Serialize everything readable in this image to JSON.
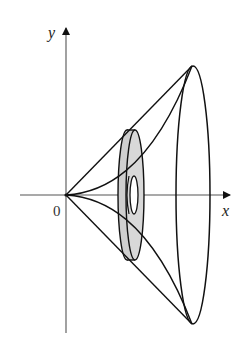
{
  "figure": {
    "axes": {
      "x_label": "x",
      "y_label": "y",
      "origin_label": "0"
    },
    "elements": {
      "outer_cone": "straight lines from origin to the top and bottom of the end ellipse",
      "inner_curve": "curves from origin tangent to x-axis meeting the end ellipse",
      "washer": "shaded annular cross-section (washer) at an intermediate x",
      "end_ellipse": "circular cross-section at the right end"
    },
    "colors": {
      "stroke": "#111111",
      "axis": "#555555",
      "washer_fill": "#cfcfcf",
      "background": "#ffffff"
    }
  }
}
